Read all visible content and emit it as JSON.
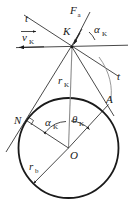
{
  "figure": {
    "background": "#ffffff",
    "stroke_color": "#1a1a1a",
    "width": 134,
    "height": 223
  },
  "labels": {
    "t_left": "t",
    "t_right": "t",
    "force": "F",
    "force_sub": "a",
    "velocity": "v",
    "velocity_sub": "K",
    "point_k": "K",
    "point_n": "N",
    "point_a": "A",
    "point_o": "O",
    "radius_k": "r",
    "radius_k_sub": "K",
    "radius_b": "r",
    "radius_b_sub": "b",
    "alpha_top": "α",
    "alpha_top_sub": "K",
    "alpha_center": "α",
    "alpha_center_sub": "K",
    "theta": "θ",
    "theta_sub": "K"
  },
  "geometry": {
    "circle": {
      "cx": 68.5,
      "cy": 148.0,
      "r": 50.0,
      "name": "base-circle"
    },
    "point_K": {
      "x": 72.0,
      "y": 47.0
    },
    "point_O": {
      "x": 68.5,
      "y": 148.0
    },
    "point_N": {
      "x": 27.0,
      "y": 120.0
    },
    "point_A": {
      "x": 108.0,
      "y": 104.0
    },
    "horizontal_line": {
      "x1": 14.0,
      "y1": 47.5,
      "x2": 128.0,
      "y2": 45.0
    },
    "tangent_line_tt": {
      "x1": 24.0,
      "y1": 15.0,
      "x2": 118.0,
      "y2": 76.0
    },
    "force_vector": {
      "x1": 72.0,
      "y1": 47.0,
      "x2": 92.0,
      "y2": 10.0
    },
    "line_KN_extended": {
      "x1": 79.0,
      "y1": 32.0,
      "x2": 8.0,
      "y2": 148.0
    },
    "line_KO": {
      "x1": 72.0,
      "y1": 47.0,
      "x2": 68.5,
      "y2": 148.0
    },
    "line_KA": {
      "x1": 72.0,
      "y1": 47.0,
      "x2": 113.0,
      "y2": 114.0
    },
    "line_ON": {
      "x1": 68.5,
      "y1": 148.0,
      "x2": 27.0,
      "y2": 120.0
    },
    "line_OA": {
      "x1": 68.5,
      "y1": 148.0,
      "x2": 108.0,
      "y2": 104.0
    },
    "line_Orb": {
      "x1": 68.5,
      "y1": 148.0,
      "x2": 33.0,
      "y2": 183.0
    },
    "arc_KA": {
      "from_x": 102.0,
      "from_y": 60.0,
      "to_x": 110.0,
      "to_y": 100.0
    },
    "angle_arc_alpha_top": {
      "cx": 72.0,
      "cy": 47.0,
      "r": 22.0
    },
    "angle_arc_center": {
      "cx": 68.5,
      "cy": 148.0,
      "r": 28.0
    }
  },
  "annotations": {
    "right_angle_at_N": true,
    "velocity_arrow_direction": "left",
    "vector_overbar_on_velocity": true
  }
}
